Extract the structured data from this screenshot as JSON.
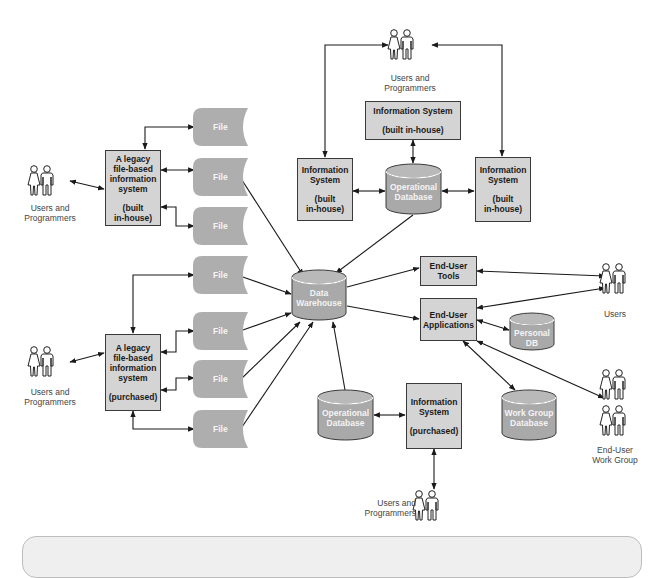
{
  "diagram": {
    "actors": {
      "top": "Users and Programmers",
      "legacy_inhouse": "Users and Programmers",
      "legacy_purchased": "Users and Programmers",
      "bottom": "Users and Programmers",
      "users": "Users",
      "workgroup": "End-User Work Group"
    },
    "actor_lines": {
      "top": [
        "Users and",
        "Programmers"
      ],
      "legacy_inhouse": [
        "Users and",
        "Programmers"
      ],
      "legacy_purchased": [
        "Users and",
        "Programmers"
      ],
      "bottom": [
        "Users and",
        "Programmers"
      ],
      "users": [
        "Users"
      ],
      "workgroup": [
        "End-User",
        "Work Group"
      ]
    },
    "systems": {
      "is_top": {
        "line1": "Information System",
        "line2": "(built in-house)"
      },
      "is_left": {
        "line1": "Information",
        "line2": "System",
        "line3": "(built",
        "line4": "in-house)"
      },
      "is_right": {
        "line1": "Information",
        "line2": "System",
        "line3": "(built",
        "line4": "in-house)"
      },
      "legacy_inhouse": {
        "line1": "A legacy",
        "line2": "file-based",
        "line3": "information",
        "line4": "system",
        "line5": "(built",
        "line6": "in-house)"
      },
      "legacy_purchased": {
        "line1": "A legacy",
        "line2": "file-based",
        "line3": "information",
        "line4": "system",
        "line5": "(purchased)"
      },
      "is_purchased": {
        "line1": "Information",
        "line2": "System",
        "line3": "(purchased)"
      },
      "eu_tools": {
        "line1": "End-User",
        "line2": "Tools"
      },
      "eu_apps": {
        "line1": "End-User",
        "line2": "Applications"
      }
    },
    "databases": {
      "op_top": {
        "line1": "Operational",
        "line2": "Database"
      },
      "warehouse": {
        "line1": "Data",
        "line2": "Warehouse"
      },
      "op_bottom": {
        "line1": "Operational",
        "line2": "Database"
      },
      "personal": {
        "line1": "Personal",
        "line2": "DB"
      },
      "workgroup": {
        "line1": "Work Group",
        "line2": "Database"
      }
    },
    "file_label": "File",
    "files": [
      "File",
      "File",
      "File",
      "File",
      "File",
      "File",
      "File"
    ],
    "colors": {
      "box_fill": "#d4d4d4",
      "box_border": "#3a3a3a",
      "shape_fill": "#a9a9a9",
      "arrow": "#1a1a1a",
      "label": "#444444"
    }
  }
}
